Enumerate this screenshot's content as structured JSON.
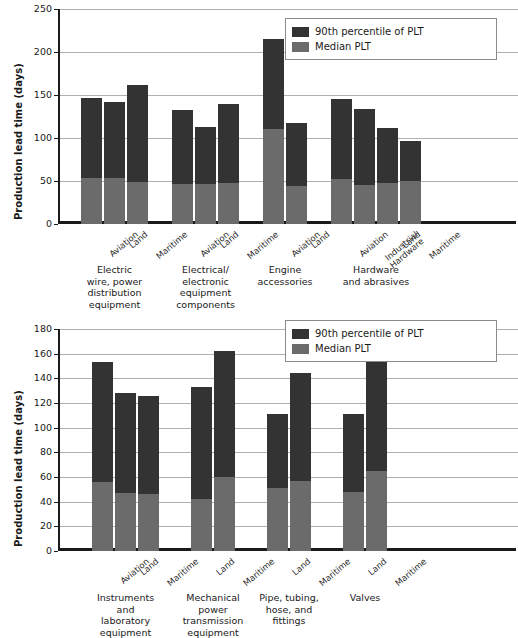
{
  "chart_data": [
    {
      "id": "top",
      "type": "bar",
      "title": "",
      "xlabel": "",
      "ylabel": "Production lead time (days)",
      "ylim": [
        0,
        250
      ],
      "yticks": [
        0,
        50,
        100,
        150,
        200,
        250
      ],
      "grid": true,
      "legend": {
        "position": "top-right",
        "entries": [
          {
            "label": "90th percentile of PLT",
            "color": "#333333"
          },
          {
            "label": "Median PLT",
            "color": "#6b6b6b"
          }
        ]
      },
      "series": [
        {
          "name": "90th percentile of PLT",
          "color": "#333333"
        },
        {
          "name": "Median PLT",
          "color": "#6b6b6b"
        }
      ],
      "groups": [
        {
          "name": "Electric\nwire, power\ndistribution\nequipment",
          "bars": [
            {
              "category": "Aviation",
              "p90": 146,
              "median": 54
            },
            {
              "category": "Land",
              "p90": 142,
              "median": 54
            },
            {
              "category": "Maritime",
              "p90": 162,
              "median": 49
            }
          ]
        },
        {
          "name": "Electrical/\nelectronic\nequipment\ncomponents",
          "bars": [
            {
              "category": "Aviation",
              "p90": 132,
              "median": 46
            },
            {
              "category": "Land",
              "p90": 113,
              "median": 46
            },
            {
              "category": "Maritime",
              "p90": 140,
              "median": 48
            }
          ]
        },
        {
          "name": "Engine\naccessories",
          "bars": [
            {
              "category": "Aviation",
              "p90": 215,
              "median": 111
            },
            {
              "category": "Land",
              "p90": 117,
              "median": 44
            }
          ]
        },
        {
          "name": "Hardware\nand abrasives",
          "bars": [
            {
              "category": "Aviation",
              "p90": 145,
              "median": 52
            },
            {
              "category": "Industrial\nHardware",
              "p90": 134,
              "median": 45
            },
            {
              "category": "Land",
              "p90": 112,
              "median": 48
            },
            {
              "category": "Maritime",
              "p90": 97,
              "median": 50
            }
          ]
        }
      ]
    },
    {
      "id": "bottom",
      "type": "bar",
      "title": "",
      "xlabel": "",
      "ylabel": "Production lead time (days)",
      "ylim": [
        0,
        180
      ],
      "yticks": [
        0,
        20,
        40,
        60,
        80,
        100,
        120,
        140,
        160,
        180
      ],
      "grid": true,
      "legend": {
        "position": "top-right",
        "entries": [
          {
            "label": "90th percentile of PLT",
            "color": "#333333"
          },
          {
            "label": "Median PLT",
            "color": "#6b6b6b"
          }
        ]
      },
      "series": [
        {
          "name": "90th percentile of PLT",
          "color": "#333333"
        },
        {
          "name": "Median PLT",
          "color": "#6b6b6b"
        }
      ],
      "groups": [
        {
          "name": "Instruments\nand\nlaboratory\nequipment",
          "bars": [
            {
              "category": "Aviation",
              "p90": 153,
              "median": 56
            },
            {
              "category": "Land",
              "p90": 128,
              "median": 47
            },
            {
              "category": "Maritime",
              "p90": 126,
              "median": 46
            }
          ]
        },
        {
          "name": "Mechanical\npower\ntransmission\nequipment",
          "bars": [
            {
              "category": "Land",
              "p90": 133,
              "median": 42
            },
            {
              "category": "Maritime",
              "p90": 162,
              "median": 60
            }
          ]
        },
        {
          "name": "Pipe, tubing,\nhose, and\nfittings",
          "bars": [
            {
              "category": "Land",
              "p90": 111,
              "median": 51
            },
            {
              "category": "Maritime",
              "p90": 144,
              "median": 57
            }
          ]
        },
        {
          "name": "Valves",
          "bars": [
            {
              "category": "Land",
              "p90": 111,
              "median": 48
            },
            {
              "category": "Maritime",
              "p90": 153,
              "median": 65
            }
          ]
        }
      ]
    }
  ]
}
